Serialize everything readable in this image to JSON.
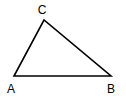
{
  "diagram": {
    "type": "triangle",
    "vertices": [
      {
        "label": "A",
        "x": 14,
        "y": 76,
        "label_x": 11,
        "label_y": 93
      },
      {
        "label": "B",
        "x": 111,
        "y": 76,
        "label_x": 111,
        "label_y": 93
      },
      {
        "label": "C",
        "x": 44,
        "y": 20,
        "label_x": 42,
        "label_y": 14
      }
    ],
    "edges": [
      [
        "A",
        "B"
      ],
      [
        "B",
        "C"
      ],
      [
        "C",
        "A"
      ]
    ],
    "stroke_color": "#000000",
    "background": "#ffffff"
  }
}
